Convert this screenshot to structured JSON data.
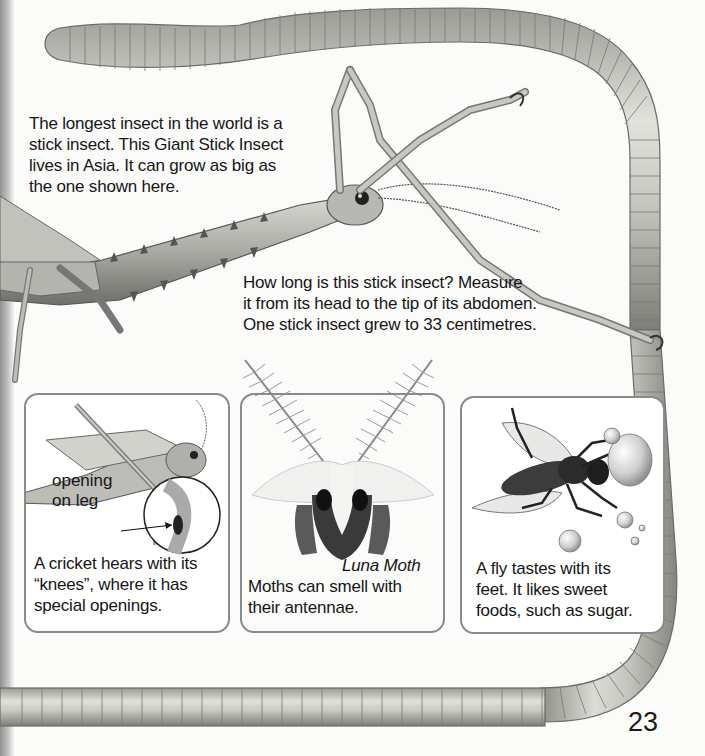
{
  "page": {
    "number": "23",
    "intro_text": [
      "The longest insect in the world is a",
      "stick insect. This Giant Stick Insect",
      "lives in Asia. It can grow as big as",
      "the one shown here."
    ],
    "question_text": [
      "How long is this stick insect? Measure",
      "it from its head to the tip of its abdomen.",
      "One stick insect grew to 33 centimetres."
    ]
  },
  "panels": [
    {
      "id": "cricket",
      "illustration": "cricket-illustration",
      "label_lines": [
        "opening",
        "on leg"
      ],
      "caption": [
        "A cricket hears with its",
        "“knees”, where it has",
        "special openings."
      ]
    },
    {
      "id": "moth",
      "illustration": "luna-moth-illustration",
      "title": "Luna Moth",
      "caption": [
        "Moths can smell with",
        "their antennae."
      ]
    },
    {
      "id": "fly",
      "illustration": "fly-illustration",
      "caption": [
        "A fly tastes with its",
        "feet. It likes sweet",
        "foods, such as sugar."
      ]
    }
  ],
  "colors": {
    "background": "#fbfbfa",
    "worm_body": "#c9c9c4",
    "worm_shadow": "#8c8c86",
    "panel_border": "#8a8a8a",
    "text": "#161616"
  }
}
